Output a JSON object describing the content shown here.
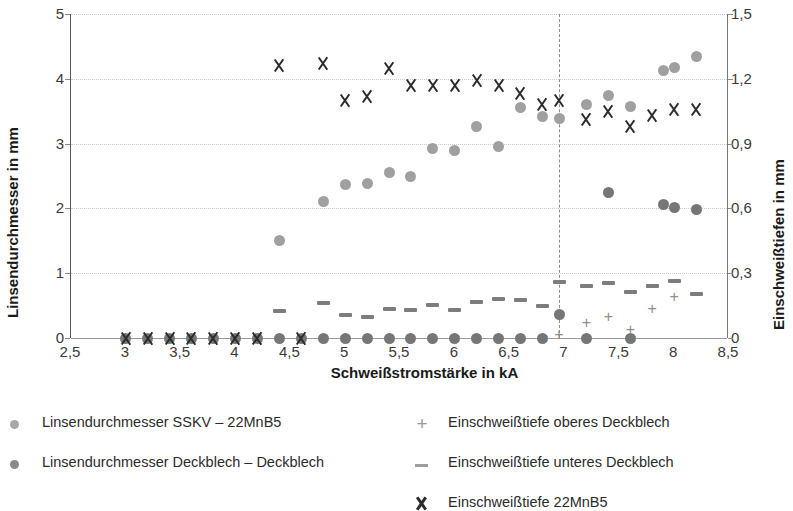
{
  "chart_data": {
    "type": "scatter",
    "title": "",
    "xlabel": "Schweißstromstärke in kA",
    "ylabel": "Linsendurchmesser in mm",
    "ylabel_secondary": "Einschweißtiefen in mm",
    "xlim": [
      2.5,
      8.5
    ],
    "ylim": [
      0,
      5
    ],
    "ylim_secondary": [
      0,
      1.5
    ],
    "xticks": [
      "2,5",
      "3",
      "3,5",
      "4",
      "4,5",
      "5",
      "5,5",
      "6",
      "6,5",
      "7",
      "7,5",
      "8",
      "8,5"
    ],
    "xtick_values": [
      2.5,
      3.0,
      3.5,
      4.0,
      4.5,
      5.0,
      5.5,
      6.0,
      6.5,
      7.0,
      7.5,
      8.0,
      8.5
    ],
    "yticks": [
      "0",
      "1",
      "2",
      "3",
      "4",
      "5"
    ],
    "ytick_values": [
      0,
      1,
      2,
      3,
      4,
      5
    ],
    "yticks_secondary": [
      "0",
      "0,3",
      "0,6",
      "0,9",
      "1,2",
      "1,5"
    ],
    "ytick_secondary_values": [
      0,
      0.3,
      0.6,
      0.9,
      1.2,
      1.5
    ],
    "grid": true,
    "legend_position": "bottom",
    "annotations": [
      {
        "type": "vertical-dashed-line",
        "x": 6.95,
        "label": ""
      }
    ],
    "series": [
      {
        "name": "Linsendurchmesser SSKV – 22MnB5",
        "marker": "circle",
        "color": "#a0a0a0",
        "axis": "left",
        "points": [
          {
            "x": 4.4,
            "y": 1.5
          },
          {
            "x": 4.8,
            "y": 2.1
          },
          {
            "x": 5.0,
            "y": 2.37
          },
          {
            "x": 5.2,
            "y": 2.39
          },
          {
            "x": 5.4,
            "y": 2.56
          },
          {
            "x": 5.6,
            "y": 2.49
          },
          {
            "x": 5.8,
            "y": 2.92
          },
          {
            "x": 6.0,
            "y": 2.9
          },
          {
            "x": 6.2,
            "y": 3.26
          },
          {
            "x": 6.4,
            "y": 2.96
          },
          {
            "x": 6.6,
            "y": 3.55
          },
          {
            "x": 6.8,
            "y": 3.42
          },
          {
            "x": 6.95,
            "y": 3.39
          },
          {
            "x": 7.2,
            "y": 3.6
          },
          {
            "x": 7.4,
            "y": 3.74
          },
          {
            "x": 7.6,
            "y": 3.58
          },
          {
            "x": 7.9,
            "y": 4.13
          },
          {
            "x": 8.0,
            "y": 4.18
          },
          {
            "x": 8.2,
            "y": 4.34
          }
        ]
      },
      {
        "name": "Linsendurchmesser Deckblech – Deckblech",
        "marker": "circle",
        "color": "#767676",
        "axis": "left",
        "points": [
          {
            "x": 3.0,
            "y": 0.0
          },
          {
            "x": 3.2,
            "y": 0.0
          },
          {
            "x": 3.4,
            "y": 0.0
          },
          {
            "x": 3.6,
            "y": 0.0
          },
          {
            "x": 3.8,
            "y": 0.0
          },
          {
            "x": 4.0,
            "y": 0.0
          },
          {
            "x": 4.2,
            "y": 0.0
          },
          {
            "x": 4.4,
            "y": 0.0
          },
          {
            "x": 4.6,
            "y": 0.0
          },
          {
            "x": 4.8,
            "y": 0.0
          },
          {
            "x": 5.0,
            "y": 0.0
          },
          {
            "x": 5.2,
            "y": 0.0
          },
          {
            "x": 5.4,
            "y": 0.0
          },
          {
            "x": 5.6,
            "y": 0.0
          },
          {
            "x": 5.8,
            "y": 0.0
          },
          {
            "x": 6.0,
            "y": 0.0
          },
          {
            "x": 6.2,
            "y": 0.0
          },
          {
            "x": 6.4,
            "y": 0.0
          },
          {
            "x": 6.6,
            "y": 0.0
          },
          {
            "x": 6.8,
            "y": 0.0
          },
          {
            "x": 6.95,
            "y": 0.36
          },
          {
            "x": 7.2,
            "y": 0.0
          },
          {
            "x": 7.4,
            "y": 2.25
          },
          {
            "x": 7.6,
            "y": 0.0
          },
          {
            "x": 7.9,
            "y": 2.06
          },
          {
            "x": 8.0,
            "y": 2.02
          },
          {
            "x": 8.2,
            "y": 1.98
          }
        ]
      },
      {
        "name": "Einschweißtiefe 22MnB5",
        "marker": "x",
        "color": "#2a2a2a",
        "axis": "right",
        "points": [
          {
            "x": 3.0,
            "y": 0.0
          },
          {
            "x": 3.2,
            "y": 0.0
          },
          {
            "x": 3.4,
            "y": 0.0
          },
          {
            "x": 3.6,
            "y": 0.0
          },
          {
            "x": 3.8,
            "y": 0.0
          },
          {
            "x": 4.0,
            "y": 0.0
          },
          {
            "x": 4.2,
            "y": 0.0
          },
          {
            "x": 4.6,
            "y": 0.0
          },
          {
            "x": 4.4,
            "y": 1.26
          },
          {
            "x": 4.8,
            "y": 1.27
          },
          {
            "x": 5.0,
            "y": 1.1
          },
          {
            "x": 5.2,
            "y": 1.12
          },
          {
            "x": 5.4,
            "y": 1.25
          },
          {
            "x": 5.6,
            "y": 1.17
          },
          {
            "x": 5.8,
            "y": 1.17
          },
          {
            "x": 6.0,
            "y": 1.17
          },
          {
            "x": 6.2,
            "y": 1.19
          },
          {
            "x": 6.4,
            "y": 1.17
          },
          {
            "x": 6.6,
            "y": 1.13
          },
          {
            "x": 6.8,
            "y": 1.08
          },
          {
            "x": 6.95,
            "y": 1.1
          },
          {
            "x": 7.2,
            "y": 1.01
          },
          {
            "x": 7.4,
            "y": 1.05
          },
          {
            "x": 7.6,
            "y": 0.98
          },
          {
            "x": 7.8,
            "y": 1.03
          },
          {
            "x": 8.0,
            "y": 1.06
          },
          {
            "x": 8.2,
            "y": 1.06
          }
        ]
      },
      {
        "name": "Einschweißtiefe unteres Deckblech",
        "marker": "dash",
        "color": "#7d7d7d",
        "axis": "right",
        "points": [
          {
            "x": 4.4,
            "y": 0.125
          },
          {
            "x": 4.8,
            "y": 0.16
          },
          {
            "x": 5.0,
            "y": 0.105
          },
          {
            "x": 5.2,
            "y": 0.095
          },
          {
            "x": 5.4,
            "y": 0.135
          },
          {
            "x": 5.6,
            "y": 0.128
          },
          {
            "x": 5.8,
            "y": 0.155
          },
          {
            "x": 6.0,
            "y": 0.128
          },
          {
            "x": 6.2,
            "y": 0.165
          },
          {
            "x": 6.4,
            "y": 0.18
          },
          {
            "x": 6.6,
            "y": 0.175
          },
          {
            "x": 6.8,
            "y": 0.15
          },
          {
            "x": 6.95,
            "y": 0.258
          },
          {
            "x": 7.2,
            "y": 0.24
          },
          {
            "x": 7.4,
            "y": 0.255
          },
          {
            "x": 7.6,
            "y": 0.215
          },
          {
            "x": 7.8,
            "y": 0.24
          },
          {
            "x": 8.0,
            "y": 0.262
          },
          {
            "x": 8.2,
            "y": 0.205
          }
        ]
      },
      {
        "name": "Einschweißtiefe oberes Deckblech",
        "marker": "plus",
        "color": "#8e8e8e",
        "axis": "right",
        "points": [
          {
            "x": 6.95,
            "y": 0.015
          },
          {
            "x": 7.2,
            "y": 0.07
          },
          {
            "x": 7.4,
            "y": 0.1
          },
          {
            "x": 7.6,
            "y": 0.04
          },
          {
            "x": 7.8,
            "y": 0.135
          },
          {
            "x": 8.0,
            "y": 0.19
          }
        ]
      }
    ]
  },
  "legend": {
    "items": [
      {
        "label": "Linsendurchmesser SSKV – 22MnB5",
        "marker": "circle-light"
      },
      {
        "label": "Linsendurchmesser Deckblech – Deckblech",
        "marker": "circle-dark"
      },
      {
        "label": "Einschweißtiefe oberes Deckblech",
        "marker": "plus"
      },
      {
        "label": "Einschweißtiefe unteres Deckblech",
        "marker": "dash"
      },
      {
        "label": "Einschweißtiefe 22MnB5",
        "marker": "x"
      }
    ]
  }
}
